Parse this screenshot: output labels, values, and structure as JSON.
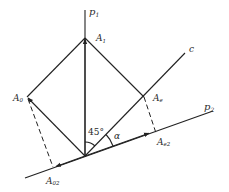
{
  "diagram": {
    "type": "vector-projection",
    "colors": {
      "line": "#222222",
      "text": "#2a2a2a",
      "background": "#ffffff"
    },
    "axes": {
      "p1": {
        "label": "p",
        "sub": "1"
      },
      "p2": {
        "label": "p",
        "sub": "2"
      },
      "c": {
        "label": "c"
      }
    },
    "points": {
      "A1": {
        "label": "A",
        "sub": "1"
      },
      "A0": {
        "label": "A",
        "sub": "0"
      },
      "Ae": {
        "label": "A",
        "sub": "e"
      },
      "Ae2": {
        "label": "A",
        "sub": "e2"
      },
      "A02": {
        "label": "A",
        "sub": "02"
      }
    },
    "angles": {
      "angle_45": "45°",
      "angle_alpha": "α"
    }
  }
}
